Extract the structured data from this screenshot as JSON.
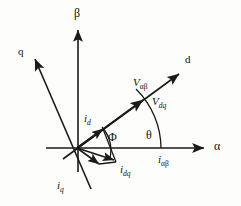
{
  "figure": {
    "type": "vector-phasor-diagram",
    "background_color": "#fdfdfc",
    "line_color": "#1a1a1a"
  },
  "axes": [
    {
      "id": "alpha",
      "label": "α",
      "kind": "greek",
      "angle_deg": 0,
      "desc": "stationary alpha axis, horizontal right"
    },
    {
      "id": "beta",
      "label": "β",
      "kind": "greek",
      "angle_deg": 90,
      "desc": "stationary beta axis, vertical up"
    },
    {
      "id": "d",
      "label": "d",
      "kind": "latin",
      "angle_deg": 36,
      "desc": "rotating direct axis"
    },
    {
      "id": "q",
      "label": "q",
      "kind": "latin",
      "angle_deg": 126,
      "desc": "rotating quadrature axis"
    }
  ],
  "vectors": [
    {
      "id": "v_alphabeta",
      "symbol": "V",
      "sub": "αβ",
      "label": "Vαβ",
      "desc": "voltage vector in alpha-beta frame, along d axis"
    },
    {
      "id": "v_dq",
      "symbol": "V",
      "sub": "dq",
      "label": "Vdq",
      "desc": "voltage vector in d-q frame"
    },
    {
      "id": "i_d",
      "symbol": "i",
      "sub": "d",
      "label": "id",
      "desc": "d-axis current component"
    },
    {
      "id": "i_q",
      "symbol": "i",
      "sub": "q",
      "label": "iq",
      "desc": "q-axis current component"
    },
    {
      "id": "i_dq",
      "symbol": "i",
      "sub": "dq",
      "label": "idq",
      "desc": "current vector in d-q frame"
    },
    {
      "id": "i_alphabeta",
      "symbol": "i",
      "sub": "αβ",
      "label": "iαβ",
      "desc": "current vector in alpha-beta frame"
    }
  ],
  "angles": [
    {
      "id": "theta",
      "label": "θ",
      "desc": "rotor/field angle between alpha axis and d axis"
    },
    {
      "id": "phi",
      "label": "Φ",
      "desc": "power factor angle between current vector and d axis"
    }
  ]
}
